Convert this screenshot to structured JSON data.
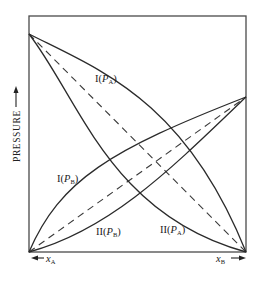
{
  "diagram": {
    "type": "vapor-pressure-composition",
    "y_axis": {
      "label": "PRESSURE",
      "arrow": "up"
    },
    "x_axis": {
      "left_label": {
        "var": "x",
        "sub": "A",
        "arrow": "left"
      },
      "right_label": {
        "var": "x",
        "sub": "B",
        "arrow": "right"
      }
    },
    "curves": [
      {
        "id": "I_PA",
        "label_prefix": "I(",
        "var": "P",
        "sub": "A",
        "label_suffix": ")",
        "style": "solid",
        "deviation": "positive"
      },
      {
        "id": "II_PA",
        "label_prefix": "II(",
        "var": "P",
        "sub": "A",
        "label_suffix": ")",
        "style": "solid",
        "deviation": "negative"
      },
      {
        "id": "I_PB",
        "label_prefix": "I(",
        "var": "P",
        "sub": "B",
        "label_suffix": ")",
        "style": "solid",
        "deviation": "positive"
      },
      {
        "id": "II_PB",
        "label_prefix": "II(",
        "var": "P",
        "sub": "B",
        "label_suffix": ")",
        "style": "solid",
        "deviation": "negative"
      },
      {
        "id": "ideal_PA",
        "style": "dashed",
        "deviation": "ideal (Raoult)"
      },
      {
        "id": "ideal_PB",
        "style": "dashed",
        "deviation": "ideal (Raoult)"
      }
    ],
    "colors": {
      "line": "#2b2b2b",
      "frame": "#4a4a4a",
      "background": "#ffffff"
    }
  }
}
